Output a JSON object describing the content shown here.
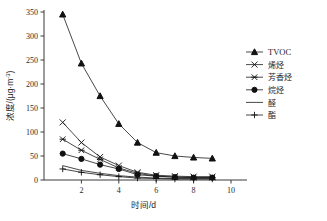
{
  "chart_data": {
    "type": "line",
    "title": "",
    "xlabel": "时间/d",
    "ylabel": "浓度/(μg·m⁻³)",
    "x": [
      1,
      2,
      3,
      4,
      5,
      6,
      7,
      8,
      9
    ],
    "xlim": [
      0,
      10
    ],
    "ylim": [
      0,
      350
    ],
    "xticks": [
      2,
      4,
      6,
      8,
      10
    ],
    "yticks": [
      0,
      50,
      100,
      150,
      200,
      250,
      300,
      350
    ],
    "grid": false,
    "legend_position": "right",
    "series": [
      {
        "name": "TVOC",
        "marker": "filled-triangle",
        "values": [
          345,
          243,
          175,
          117,
          78,
          57,
          50,
          47,
          45
        ]
      },
      {
        "name": "烯烃",
        "marker": "cross-x",
        "values": [
          120,
          78,
          48,
          30,
          16,
          10,
          8,
          7,
          7
        ]
      },
      {
        "name": "芳香烃",
        "marker": "asterisk",
        "values": [
          85,
          62,
          43,
          25,
          14,
          8,
          6,
          5,
          5
        ]
      },
      {
        "name": "烷烃",
        "marker": "filled-circle",
        "values": [
          55,
          44,
          32,
          23,
          11,
          8,
          6,
          5,
          5
        ]
      },
      {
        "name": "醛",
        "marker": "none",
        "values": [
          30,
          20,
          14,
          9,
          6,
          4,
          3,
          3,
          3
        ]
      },
      {
        "name": "酯",
        "marker": "plus",
        "values": [
          23,
          16,
          11,
          7,
          4,
          3,
          2,
          2,
          2
        ]
      }
    ]
  },
  "axes": {
    "y_tick_labels": [
      "0",
      "50",
      "100",
      "150",
      "200",
      "250",
      "300",
      "350"
    ],
    "x_tick_labels": [
      "2",
      "4",
      "6",
      "8",
      "10"
    ],
    "x_title": "时间/d",
    "y_title_main": "浓度/(μg·m",
    "y_title_sup": "-3",
    "y_title_tail": ")"
  },
  "legend": {
    "entries": [
      {
        "label": "TVOC"
      },
      {
        "label": "烯烃"
      },
      {
        "label": "芳香烃"
      },
      {
        "label": "烷烃"
      },
      {
        "label": "醛"
      },
      {
        "label": "酯"
      }
    ]
  },
  "colors": {
    "line": "#1a1a1a",
    "axis": "#3a3a3a",
    "text": "#1d1d1d",
    "background": "#ffffff"
  }
}
